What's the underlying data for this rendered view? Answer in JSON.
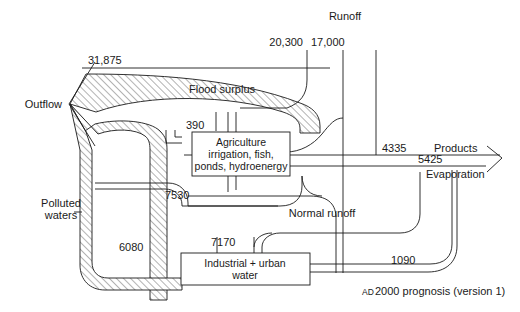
{
  "figure": {
    "caption_smallcaps": "AD",
    "caption_rest": " 2000 prognosis (version 1)",
    "caption_full": "AD 2000 prognosis (version 1)"
  },
  "nodes": [
    {
      "id": "agriculture",
      "lines": [
        "Agriculture",
        "irrigation, fish,",
        "ponds, hydroenergy"
      ]
    },
    {
      "id": "industrial",
      "lines": [
        "Industrial + urban",
        "water"
      ]
    }
  ],
  "labels": {
    "outflow": "Outflow",
    "flood_surplus": "Flood surplus",
    "runoff": "Runoff",
    "polluted_waters_line1": "Polluted",
    "polluted_waters_line2": "waters",
    "normal_runoff": "Normal runoff",
    "products": "Products",
    "evaporation": "Evaporation"
  },
  "values": {
    "outflow_total": "31,875",
    "runoff_left": "20,300",
    "runoff_right": "17,000",
    "flood_to_agri": "390",
    "agri_return": "7530",
    "polluted_industrial": "6080",
    "industrial_intake": "7170",
    "products": "4335",
    "evaporation": "5425",
    "industrial_out": "1090"
  },
  "colors": {
    "stroke": "#1a1a1a",
    "background": "#ffffff",
    "hatch": "#555555"
  }
}
